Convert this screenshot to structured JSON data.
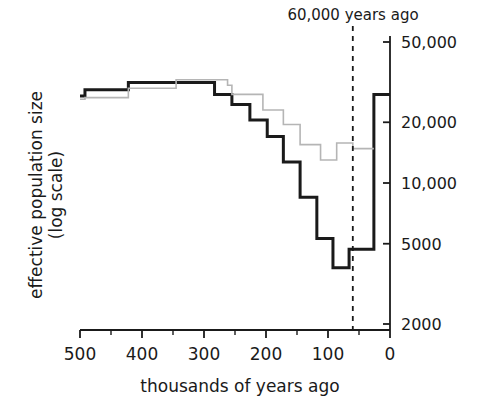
{
  "chart_data": {
    "type": "line",
    "title": "",
    "subtitle": "",
    "xlabel": "thousands of years ago",
    "ylabel": "effective population size\n(log scale)",
    "ylabel_line1": "effective population size",
    "ylabel_line2": "(log scale)",
    "xlim": [
      500,
      0
    ],
    "ylim": [
      2000,
      60000
    ],
    "yscale": "log",
    "xscale": "linear",
    "grid": false,
    "legend": "none",
    "x_ticks": [
      500,
      400,
      300,
      200,
      100,
      0
    ],
    "x_tick_labels": [
      "500",
      "400",
      "300",
      "200",
      "100",
      "0"
    ],
    "x_minor_ticks": [
      450,
      350,
      250,
      150,
      50
    ],
    "y_ticks": [
      50000,
      20000,
      10000,
      5000,
      2000
    ],
    "y_tick_labels": [
      "50,000",
      "20,000",
      "10,000",
      "5000",
      "2000"
    ],
    "annotations": [
      {
        "name": "sixty-thousand-years-ago",
        "text": "60,000 years ago",
        "x": 60,
        "type": "vertical-dashed-line",
        "color": "#1a1a1a"
      }
    ],
    "series": [
      {
        "name": "non-african-population",
        "style": "step",
        "color": "#1a1a1a",
        "linewidth": 3,
        "points": [
          [
            500,
            27000
          ],
          [
            492,
            29000
          ],
          [
            430,
            29000
          ],
          [
            422,
            31500
          ],
          [
            352,
            31500
          ],
          [
            345,
            31500
          ],
          [
            290,
            31500
          ],
          [
            283,
            27500
          ],
          [
            262,
            27500
          ],
          [
            255,
            24500
          ],
          [
            232,
            24500
          ],
          [
            226,
            20500
          ],
          [
            205,
            20500
          ],
          [
            198,
            17000
          ],
          [
            178,
            17000
          ],
          [
            172,
            12700
          ],
          [
            152,
            12700
          ],
          [
            145,
            8500
          ],
          [
            125,
            8500
          ],
          [
            118,
            5300
          ],
          [
            98,
            5300
          ],
          [
            92,
            3800
          ],
          [
            72,
            3800
          ],
          [
            66,
            4700
          ],
          [
            32,
            4700
          ],
          [
            26,
            27500
          ],
          [
            0,
            27500
          ]
        ]
      },
      {
        "name": "african-population",
        "style": "step",
        "color": "#b5b5b5",
        "linewidth": 1.6,
        "points": [
          [
            500,
            26000
          ],
          [
            492,
            26500
          ],
          [
            430,
            26500
          ],
          [
            422,
            29500
          ],
          [
            352,
            29500
          ],
          [
            345,
            32500
          ],
          [
            290,
            32500
          ],
          [
            283,
            32500
          ],
          [
            262,
            30500
          ],
          [
            255,
            27500
          ],
          [
            232,
            27500
          ],
          [
            226,
            27500
          ],
          [
            205,
            23000
          ],
          [
            178,
            23000
          ],
          [
            172,
            19500
          ],
          [
            152,
            19500
          ],
          [
            145,
            15500
          ],
          [
            118,
            15500
          ],
          [
            112,
            13000
          ],
          [
            92,
            13000
          ],
          [
            86,
            15800
          ],
          [
            66,
            15800
          ],
          [
            60,
            14800
          ],
          [
            26,
            14800
          ]
        ]
      }
    ]
  },
  "axes": {
    "y_axis_side": "right",
    "x_axis_side": "bottom",
    "axis_color": "#1a1a1a"
  }
}
